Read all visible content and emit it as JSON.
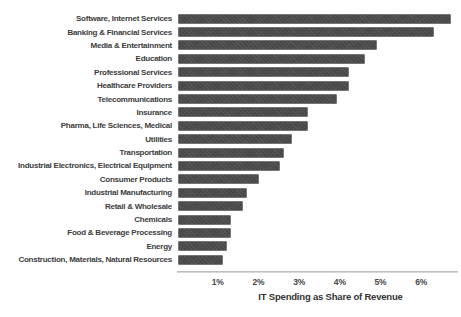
{
  "chart_data": {
    "type": "bar",
    "orientation": "horizontal",
    "title": "",
    "xlabel": "IT Spending as Share of Revenue",
    "ylabel": "",
    "categories": [
      "Software, Internet Services",
      "Banking & Financial Services",
      "Media & Entertainment",
      "Education",
      "Professional Services",
      "Healthcare Providers",
      "Telecommunications",
      "Insurance",
      "Pharma, Life Sciences, Medical",
      "Utilities",
      "Transportation",
      "Industrial Electronics, Electrical Equipment",
      "Consumer Products",
      "Industrial Manufacturing",
      "Retail & Wholesale",
      "Chemicals",
      "Food & Beverage Processing",
      "Energy",
      "Construction, Materials, Natural Resources"
    ],
    "values": [
      6.7,
      6.3,
      4.9,
      4.6,
      4.2,
      4.2,
      3.9,
      3.2,
      3.2,
      2.8,
      2.6,
      2.5,
      2.0,
      1.7,
      1.6,
      1.3,
      1.3,
      1.2,
      1.1
    ],
    "value_unit": "%",
    "xtick_labels": [
      "1%",
      "2%",
      "3%",
      "4%",
      "5%",
      "6%"
    ],
    "xtick_values": [
      1,
      2,
      3,
      4,
      5,
      6
    ],
    "xlim": [
      0,
      6.9
    ],
    "grid": false,
    "legend": null,
    "bar_color": "#4e4e4e",
    "bar_border_color": "#757575",
    "label_color": "#3c3c3c",
    "axis_line_color": "#b2b2b2",
    "background_color": "#ffffff"
  }
}
